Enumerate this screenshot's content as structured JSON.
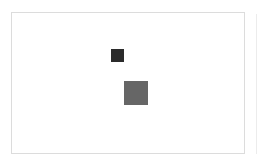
{
  "frame": {
    "border_color": "#dcdcdc",
    "background": "#ffffff"
  },
  "shapes": [
    {
      "name": "small-dark-square",
      "color": "#2b2b2b",
      "x": 111,
      "y": 49,
      "size": 13
    },
    {
      "name": "large-gray-square",
      "color": "#666666",
      "x": 124,
      "y": 81,
      "size": 24
    }
  ]
}
